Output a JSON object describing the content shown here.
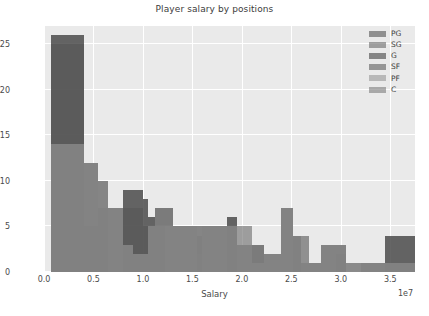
{
  "chart_data": {
    "type": "bar",
    "title": "Player salary by positions",
    "xlabel": "Salary",
    "ylabel": "Frequency",
    "exponent_label": "1e7",
    "grid": true,
    "legend_position": "upper right",
    "xlim": [
      0,
      37500000.0
    ],
    "ylim": [
      0,
      27
    ],
    "xticks": [
      0.0,
      0.5,
      1.0,
      1.5,
      2.0,
      2.5,
      3.0,
      3.5
    ],
    "xticklabels": [
      "0.0",
      "0.5",
      "1.0",
      "1.5",
      "2.0",
      "2.5",
      "3.0",
      "3.5"
    ],
    "yticks": [
      0,
      5,
      10,
      15,
      20,
      25
    ],
    "yticklabels": [
      "0",
      "5",
      "10",
      "15",
      "20",
      "25"
    ],
    "bin_edges": [
      700000.0,
      4000000.0,
      5500000.0,
      6500000.0,
      8000000.0,
      9000000.0,
      10000000.0,
      10500000.0,
      11200000.0,
      12200000.0,
      13000000.0,
      15500000.0,
      16000000.0,
      18500000.0,
      19500000.0,
      21000000.0,
      22200000.0,
      23000000.0,
      24000000.0,
      25200000.0,
      26000000.0,
      26800000.0,
      28000000.0,
      29500000.0,
      30500000.0,
      32000000.0,
      34500000.0,
      37500000.0
    ],
    "series": [
      {
        "name": "PG",
        "color": "#595959",
        "bars": [
          {
            "x0": 700000.0,
            "x1": 4000000.0,
            "y": 26
          },
          {
            "x0": 4000000.0,
            "x1": 5500000.0,
            "y": 12
          },
          {
            "x0": 5500000.0,
            "x1": 8000000.0,
            "y": 7
          },
          {
            "x0": 8000000.0,
            "x1": 10000000.0,
            "y": 9
          },
          {
            "x0": 10000000.0,
            "x1": 10500000.0,
            "y": 8
          },
          {
            "x0": 10500000.0,
            "x1": 11200000.0,
            "y": 6
          },
          {
            "x0": 11200000.0,
            "x1": 13000000.0,
            "y": 7
          },
          {
            "x0": 13000000.0,
            "x1": 18500000.0,
            "y": 5
          },
          {
            "x0": 18500000.0,
            "x1": 19500000.0,
            "y": 6
          },
          {
            "x0": 19500000.0,
            "x1": 22200000.0,
            "y": 3
          },
          {
            "x0": 22200000.0,
            "x1": 24000000.0,
            "y": 2
          },
          {
            "x0": 24000000.0,
            "x1": 25200000.0,
            "y": 7
          },
          {
            "x0": 25200000.0,
            "x1": 26800000.0,
            "y": 4
          },
          {
            "x0": 26800000.0,
            "x1": 28000000.0,
            "y": 1
          },
          {
            "x0": 28000000.0,
            "x1": 30500000.0,
            "y": 3
          },
          {
            "x0": 30500000.0,
            "x1": 32000000.0,
            "y": 0
          },
          {
            "x0": 32000000.0,
            "x1": 34500000.0,
            "y": 1
          },
          {
            "x0": 34500000.0,
            "x1": 37500000.0,
            "y": 4
          }
        ]
      },
      {
        "name": "SG",
        "color": "#6e6e6e",
        "bars": [
          {
            "x0": 700000.0,
            "x1": 4000000.0,
            "y": 25
          },
          {
            "x0": 4000000.0,
            "x1": 5500000.0,
            "y": 12
          },
          {
            "x0": 5500000.0,
            "x1": 6500000.0,
            "y": 7
          },
          {
            "x0": 6500000.0,
            "x1": 10000000.0,
            "y": 7
          },
          {
            "x0": 10000000.0,
            "x1": 11200000.0,
            "y": 5
          },
          {
            "x0": 11200000.0,
            "x1": 13000000.0,
            "y": 7
          },
          {
            "x0": 13000000.0,
            "x1": 19500000.0,
            "y": 5
          },
          {
            "x0": 19500000.0,
            "x1": 21000000.0,
            "y": 5
          },
          {
            "x0": 21000000.0,
            "x1": 22200000.0,
            "y": 3
          },
          {
            "x0": 22200000.0,
            "x1": 24000000.0,
            "y": 2
          },
          {
            "x0": 24000000.0,
            "x1": 25200000.0,
            "y": 7
          },
          {
            "x0": 25200000.0,
            "x1": 26000000.0,
            "y": 2
          },
          {
            "x0": 26000000.0,
            "x1": 28000000.0,
            "y": 1
          },
          {
            "x0": 28000000.0,
            "x1": 30500000.0,
            "y": 3
          },
          {
            "x0": 30500000.0,
            "x1": 32000000.0,
            "y": 1
          },
          {
            "x0": 32000000.0,
            "x1": 37500000.0,
            "y": 1
          }
        ]
      },
      {
        "name": "G",
        "color": "#474747",
        "bars": [
          {
            "x0": 700000.0,
            "x1": 4000000.0,
            "y": 26
          },
          {
            "x0": 4000000.0,
            "x1": 5500000.0,
            "y": 5
          },
          {
            "x0": 5500000.0,
            "x1": 6500000.0,
            "y": 10
          },
          {
            "x0": 8000000.0,
            "x1": 10000000.0,
            "y": 9
          },
          {
            "x0": 10000000.0,
            "x1": 10500000.0,
            "y": 8
          },
          {
            "x0": 10500000.0,
            "x1": 11200000.0,
            "y": 6
          },
          {
            "x0": 11200000.0,
            "x1": 12200000.0,
            "y": 5
          },
          {
            "x0": 15500000.0,
            "x1": 16000000.0,
            "y": 4
          },
          {
            "x0": 18500000.0,
            "x1": 19500000.0,
            "y": 6
          },
          {
            "x0": 25200000.0,
            "x1": 26000000.0,
            "y": 4
          },
          {
            "x0": 29500000.0,
            "x1": 30500000.0,
            "y": 2
          },
          {
            "x0": 34500000.0,
            "x1": 37500000.0,
            "y": 4
          }
        ]
      },
      {
        "name": "SF",
        "color": "#626262",
        "bars": [
          {
            "x0": 700000.0,
            "x1": 4000000.0,
            "y": 14
          },
          {
            "x0": 4000000.0,
            "x1": 5500000.0,
            "y": 12
          },
          {
            "x0": 5500000.0,
            "x1": 8000000.0,
            "y": 7
          },
          {
            "x0": 8000000.0,
            "x1": 9000000.0,
            "y": 3
          },
          {
            "x0": 9000000.0,
            "x1": 10500000.0,
            "y": 2
          },
          {
            "x0": 10500000.0,
            "x1": 11200000.0,
            "y": 5
          },
          {
            "x0": 11200000.0,
            "x1": 13000000.0,
            "y": 5
          },
          {
            "x0": 13000000.0,
            "x1": 15500000.0,
            "y": 5
          },
          {
            "x0": 15500000.0,
            "x1": 16000000.0,
            "y": 2
          },
          {
            "x0": 16000000.0,
            "x1": 19500000.0,
            "y": 5
          },
          {
            "x0": 19500000.0,
            "x1": 21000000.0,
            "y": 3
          },
          {
            "x0": 21000000.0,
            "x1": 22200000.0,
            "y": 1
          },
          {
            "x0": 22200000.0,
            "x1": 24000000.0,
            "y": 2
          },
          {
            "x0": 24000000.0,
            "x1": 25200000.0,
            "y": 7
          },
          {
            "x0": 25200000.0,
            "x1": 26000000.0,
            "y": 4
          },
          {
            "x0": 26000000.0,
            "x1": 28000000.0,
            "y": 1
          },
          {
            "x0": 28000000.0,
            "x1": 30500000.0,
            "y": 3
          },
          {
            "x0": 32000000.0,
            "x1": 37500000.0,
            "y": 1
          }
        ]
      },
      {
        "name": "PF",
        "color": "#9a9a9a",
        "bars": [
          {
            "x0": 700000.0,
            "x1": 4000000.0,
            "y": 14
          },
          {
            "x0": 4000000.0,
            "x1": 5500000.0,
            "y": 12
          },
          {
            "x0": 5500000.0,
            "x1": 8000000.0,
            "y": 7
          },
          {
            "x0": 8000000.0,
            "x1": 9000000.0,
            "y": 3
          },
          {
            "x0": 9000000.0,
            "x1": 10500000.0,
            "y": 2
          },
          {
            "x0": 10500000.0,
            "x1": 13000000.0,
            "y": 5
          },
          {
            "x0": 13000000.0,
            "x1": 19500000.0,
            "y": 5
          },
          {
            "x0": 19500000.0,
            "x1": 21000000.0,
            "y": 3
          },
          {
            "x0": 21000000.0,
            "x1": 22200000.0,
            "y": 1
          },
          {
            "x0": 22200000.0,
            "x1": 24000000.0,
            "y": 2
          },
          {
            "x0": 24000000.0,
            "x1": 25200000.0,
            "y": 7
          },
          {
            "x0": 25200000.0,
            "x1": 26000000.0,
            "y": 4
          },
          {
            "x0": 26000000.0,
            "x1": 28000000.0,
            "y": 1
          },
          {
            "x0": 28000000.0,
            "x1": 30500000.0,
            "y": 3
          },
          {
            "x0": 30500000.0,
            "x1": 32000000.0,
            "y": 1
          },
          {
            "x0": 32000000.0,
            "x1": 37500000.0,
            "y": 1
          }
        ]
      },
      {
        "name": "C",
        "color": "#808080",
        "bars": [
          {
            "x0": 700000.0,
            "x1": 4000000.0,
            "y": 14
          },
          {
            "x0": 4000000.0,
            "x1": 5500000.0,
            "y": 12
          },
          {
            "x0": 5500000.0,
            "x1": 8000000.0,
            "y": 7
          },
          {
            "x0": 8000000.0,
            "x1": 9000000.0,
            "y": 3
          },
          {
            "x0": 9000000.0,
            "x1": 10500000.0,
            "y": 2
          },
          {
            "x0": 10500000.0,
            "x1": 13000000.0,
            "y": 5
          },
          {
            "x0": 13000000.0,
            "x1": 19500000.0,
            "y": 5
          },
          {
            "x0": 19500000.0,
            "x1": 21000000.0,
            "y": 3
          },
          {
            "x0": 21000000.0,
            "x1": 22200000.0,
            "y": 1
          },
          {
            "x0": 22200000.0,
            "x1": 24000000.0,
            "y": 2
          },
          {
            "x0": 24000000.0,
            "x1": 25200000.0,
            "y": 7
          },
          {
            "x0": 25200000.0,
            "x1": 26000000.0,
            "y": 4
          },
          {
            "x0": 26000000.0,
            "x1": 28000000.0,
            "y": 1
          },
          {
            "x0": 28000000.0,
            "x1": 30500000.0,
            "y": 3
          },
          {
            "x0": 30500000.0,
            "x1": 32000000.0,
            "y": 1
          },
          {
            "x0": 32000000.0,
            "x1": 37500000.0,
            "y": 1
          }
        ]
      }
    ]
  },
  "style": {
    "axes_facecolor": "#eaeaea",
    "figure_facecolor": "#ffffff",
    "grid_color": "#ffffff",
    "text_color": "#3b3b3b"
  }
}
